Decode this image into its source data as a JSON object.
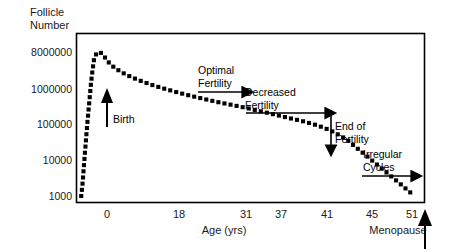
{
  "chart_data": {
    "type": "line",
    "title": "",
    "ylabel": "Follicle\nNumber",
    "xlabel": "Age (yrs)",
    "y_scale": "log",
    "y_tick_labels": [
      "8000000",
      "1000000",
      "100000",
      "10000",
      "1000"
    ],
    "y_tick_values": [
      8000000,
      1000000,
      100000,
      10000,
      1000
    ],
    "ylim": [
      1000,
      8000000
    ],
    "x_tick_labels": [
      "0",
      "18",
      "31",
      "37",
      "41",
      "45",
      "51"
    ],
    "x_tick_values": [
      0,
      18,
      31,
      37,
      41,
      45,
      51
    ],
    "xlim": [
      -6,
      53
    ],
    "grid": false,
    "legend": null,
    "line_style": "dotted-thick",
    "series": [
      {
        "name": "Follicle number",
        "x": [
          -5.2,
          -5.0,
          -4.8,
          -4.6,
          -4.4,
          -4.2,
          -4.0,
          -3.8,
          -3.6,
          -3.4,
          -3.2,
          -3.0,
          -2.6,
          -2.2,
          -1.6,
          -1.0,
          -0.3,
          0.6,
          1.8,
          3.2,
          5.0,
          7.0,
          9.5,
          12.0,
          15.0,
          18.0,
          21.0,
          24.0,
          27.0,
          30.0,
          32.5,
          35.0,
          37.0,
          38.5,
          40.0,
          41.2,
          42.5,
          44.0,
          45.5,
          47.0,
          48.5,
          50.0,
          51.0
        ],
        "y": [
          1000,
          2000,
          5000,
          13000,
          32000,
          80000,
          180000,
          400000,
          900000,
          1800000,
          3200000,
          5200000,
          7200000,
          8000000,
          7000000,
          5200000,
          3800000,
          2900000,
          2200000,
          1700000,
          1300000,
          1000000,
          760000,
          590000,
          450000,
          350000,
          280000,
          220000,
          170000,
          130000,
          105000,
          80000,
          60000,
          45000,
          32000,
          22000,
          15000,
          9500,
          6000,
          3800,
          2400,
          1500,
          1100
        ]
      }
    ],
    "annotations": [
      {
        "name": "birth",
        "text": "Birth",
        "arrow": "up"
      },
      {
        "name": "optimal-fertility",
        "text": "Optimal\nFertility",
        "arrow": "right"
      },
      {
        "name": "decreased-fertility",
        "text": "Decreased\nFertility",
        "arrow": "right"
      },
      {
        "name": "end-of-fertility",
        "text": "End of\nFertility",
        "arrow": "down"
      },
      {
        "name": "irregular-cycles",
        "text": "Irregular\nCycles",
        "arrow": "right"
      },
      {
        "name": "menopause",
        "text": "Menopause",
        "arrow": "up"
      }
    ]
  },
  "axes": {
    "y_title": "Follicle\nNumber",
    "x_title": "Age (yrs)",
    "y_ticks": [
      {
        "label": "8000000",
        "py": 52
      },
      {
        "label": "1000000",
        "py": 89
      },
      {
        "label": "100000",
        "py": 124
      },
      {
        "label": "10000",
        "py": 160
      },
      {
        "label": "1000",
        "py": 196
      }
    ],
    "x_ticks": [
      {
        "label": "0",
        "px": 107
      },
      {
        "label": "18",
        "px": 179
      },
      {
        "label": "31",
        "px": 246
      },
      {
        "label": "37",
        "px": 281
      },
      {
        "label": "41",
        "px": 327
      },
      {
        "label": "45",
        "px": 372
      },
      {
        "label": "51",
        "px": 412
      }
    ]
  },
  "labels": {
    "birth": "Birth",
    "optimal_fertility": "Optimal\nFertility",
    "decreased_fertility": "Decreased\nFertility",
    "end_of_fertility": "End of\nFertility",
    "irregular_cycles": "Irregular\nCycles",
    "menopause": "Menopause"
  },
  "colors": {
    "background": "#ffffff",
    "ink": "#000000",
    "text": "#1a1a1a",
    "frame": "#000000"
  }
}
